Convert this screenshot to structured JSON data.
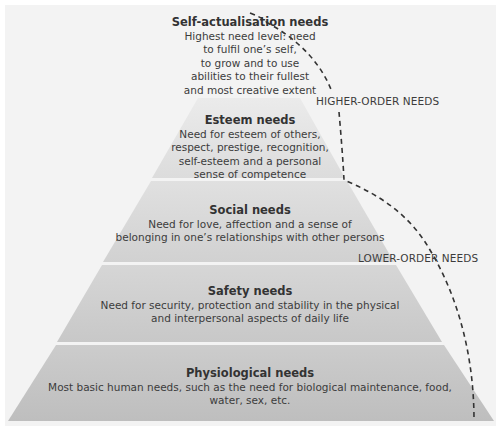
{
  "diagram": {
    "type": "pyramid",
    "colors": {
      "background": "#f3f3f3",
      "esteem": "#e2e2e2",
      "social": "#d8d8d8",
      "safety": "#cecece",
      "physiological": "#c4c4c4",
      "separator": "#ececec",
      "dashed_line": "#333333"
    },
    "levels": [
      {
        "id": "self-actualisation",
        "title": "Self-actualisation needs",
        "description_lines": [
          "Highest need level: need",
          "to fulfil one’s self,",
          "to grow and to use",
          "abilities to their fullest",
          "and most creative extent"
        ]
      },
      {
        "id": "esteem",
        "title": "Esteem needs",
        "description_lines": [
          "Need for esteem of others,",
          "respect, prestige, recognition,",
          "self-esteem and a personal",
          "sense of competence"
        ]
      },
      {
        "id": "social",
        "title": "Social needs",
        "description_lines": [
          "Need for love, affection and a sense of",
          "belonging in one’s relationships with other persons"
        ]
      },
      {
        "id": "safety",
        "title": "Safety needs",
        "description_lines": [
          "Need for security, protection and stability in the physical",
          "and interpersonal aspects of daily life"
        ]
      },
      {
        "id": "physiological",
        "title": "Physiological needs",
        "description_lines": [
          "Most basic human needs, such as the need for biological maintenance, food,",
          "water, sex, etc."
        ]
      }
    ],
    "groups": {
      "higher": "HIGHER-ORDER NEEDS",
      "lower": "LOWER-ORDER NEEDS"
    }
  }
}
